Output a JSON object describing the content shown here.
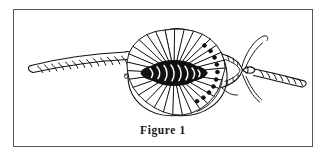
{
  "figure": {
    "caption": "Figure 1",
    "alt_description": "Line drawing of a decorative rosette rope knot with rope running left and right",
    "frame": {
      "border_color": "#55555c",
      "background_color": "#ffffff"
    },
    "artwork": {
      "ink_color": "#101010",
      "fill_color": "#ffffff",
      "elements": [
        {
          "name": "rope-left",
          "label": "left rope strand"
        },
        {
          "name": "rope-right",
          "label": "right rope strand"
        },
        {
          "name": "rosette-knot",
          "label": "radiating rosette knot"
        },
        {
          "name": "knot-core",
          "label": "dark knot core"
        },
        {
          "name": "knot-collar",
          "label": "collar / funnel wrap"
        },
        {
          "name": "loose-strands",
          "label": "loose strand ends"
        },
        {
          "name": "spiral-curl",
          "label": "small spiral curl"
        }
      ]
    }
  },
  "page": {
    "background_color": "#ffffff"
  }
}
